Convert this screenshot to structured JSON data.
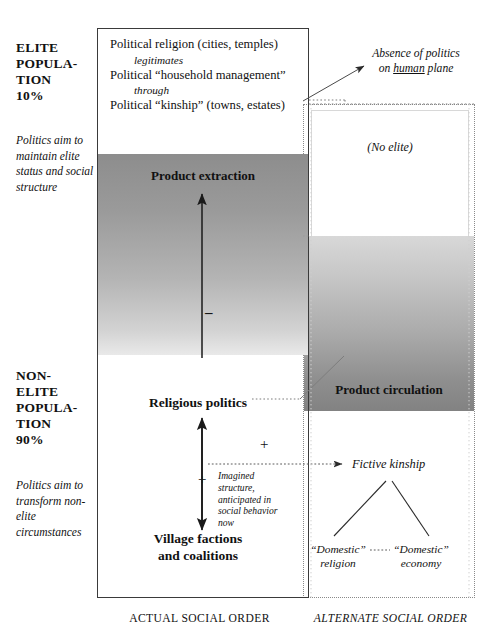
{
  "diagram": {
    "title_captions": {
      "actual": "ACTUAL SOCIAL ORDER",
      "alternate": "ALTERNATE SOCIAL ORDER"
    },
    "left_labels": {
      "elite_heading": "ELITE POPULA- TION 10%",
      "elite_heading_lines": [
        "ELITE",
        "POPULA-",
        "TION",
        "10%"
      ],
      "elite_note": "Politics aim to maintain elite status and social structure",
      "nonelite_heading_lines": [
        "NON-",
        "ELITE",
        "POPULA-",
        "TION",
        "90%"
      ],
      "nonelite_note": "Politics aim to transform non-elite circumstances"
    },
    "actual_order": {
      "elite_box": {
        "line1": "Political religion (cities, temples)",
        "connector1": "legitimates",
        "line2": "Political “household  management”",
        "connector2": "through",
        "line3": "Political “kinship” (towns, estates)"
      },
      "extraction_label": "Product extraction",
      "religious_politics_label": "Religious politics",
      "village_label_lines": [
        "Village factions",
        "and coalitions"
      ],
      "sign_minus": "–",
      "sign_plus_lower": "+",
      "sign_plus_upper": "+"
    },
    "alternate_order": {
      "absence_line1": "Absence of politics",
      "absence_line2_pre": "on ",
      "absence_line2_underlined": "human",
      "absence_line2_post": " plane",
      "no_elite": "(No elite)",
      "circulation_label": "Product circulation",
      "fictive_kinship": "Fictive kinship",
      "domestic_religion_lines": [
        "“Domestic”",
        "religion"
      ],
      "domestic_economy_lines": [
        "“Domestic”",
        "economy"
      ]
    },
    "annotations": {
      "imagined_structure": "Imagined structure, anticipated in social behavior now"
    },
    "colors": {
      "ink": "#111111",
      "box_border": "#3a3a3a",
      "dotted_border": "#8a8a8a",
      "extraction_dark": "#8d8d8d",
      "extraction_light": "#e9e9e9",
      "circulation_light": "#d8d8d8",
      "circulation_dark": "#828282"
    }
  }
}
